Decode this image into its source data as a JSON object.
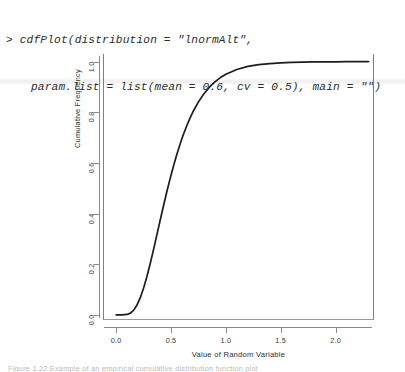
{
  "console": {
    "prompt": ">",
    "line1": "> cdfPlot(distribution = \"lnormAlt\",",
    "line2": "param.list = list(mean = 0.6, cv = 0.5), main = \"\")"
  },
  "caption": {
    "text": "Figure 1.22 Example of an empirical cumulative distribution function plot"
  },
  "chart_data": {
    "type": "line",
    "title": "",
    "xlabel": "Value of Random Variable",
    "ylabel": "Cumulative Frequency",
    "xlim": [
      -0.12,
      2.35
    ],
    "ylim": [
      -0.02,
      1.03
    ],
    "xticks": [
      "0.0",
      "0.5",
      "1.0",
      "1.5",
      "2.0"
    ],
    "xtick_values": [
      0.0,
      0.5,
      1.0,
      1.5,
      2.0
    ],
    "yticks": [
      "0.0",
      "0.2",
      "0.4",
      "0.6",
      "0.8",
      "1.0"
    ],
    "ytick_values": [
      0.0,
      0.2,
      0.4,
      0.6,
      0.8,
      1.0
    ],
    "grid": false,
    "legend": null,
    "distribution": "lnormAlt",
    "params": {
      "mean": 0.6,
      "cv": 0.5
    },
    "series": [
      {
        "name": "Cumulative Frequency",
        "color": "#1c1c1c",
        "x": [
          0.0,
          0.05,
          0.1,
          0.13,
          0.16,
          0.19,
          0.22,
          0.25,
          0.28,
          0.31,
          0.34,
          0.37,
          0.4,
          0.43,
          0.46,
          0.49,
          0.52,
          0.55,
          0.58,
          0.61,
          0.64,
          0.67,
          0.7,
          0.75,
          0.8,
          0.85,
          0.9,
          0.95,
          1.0,
          1.1,
          1.2,
          1.3,
          1.4,
          1.5,
          1.6,
          1.7,
          1.8,
          1.9,
          2.0,
          2.1,
          2.2,
          2.3
        ],
        "y": [
          0.0,
          0.0,
          0.002,
          0.007,
          0.019,
          0.039,
          0.068,
          0.106,
          0.151,
          0.202,
          0.257,
          0.314,
          0.372,
          0.428,
          0.483,
          0.535,
          0.584,
          0.629,
          0.671,
          0.709,
          0.743,
          0.774,
          0.802,
          0.841,
          0.873,
          0.899,
          0.92,
          0.937,
          0.95,
          0.969,
          0.981,
          0.988,
          0.992,
          0.995,
          0.997,
          0.998,
          0.999,
          0.999,
          0.999,
          1.0,
          1.0,
          1.0
        ]
      }
    ]
  }
}
